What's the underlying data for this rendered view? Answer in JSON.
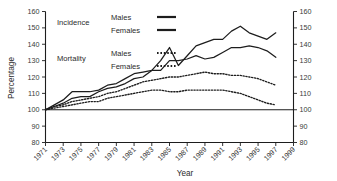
{
  "chart_data": {
    "type": "line",
    "title": "",
    "xlabel": "Year",
    "ylabel": "Percentage",
    "xlim": [
      1971,
      1999
    ],
    "ylim": [
      80,
      160
    ],
    "grid": false,
    "legend_position": "top-left-inside",
    "y_ticks": [
      80,
      90,
      100,
      110,
      120,
      130,
      140,
      150,
      160
    ],
    "y_ticks_right": [
      80,
      90,
      100,
      110,
      120,
      130,
      140,
      150,
      160
    ],
    "x_ticks": [
      1971,
      1973,
      1975,
      1977,
      1979,
      1981,
      1983,
      1985,
      1987,
      1989,
      1991,
      1993,
      1995,
      1997,
      1999
    ],
    "reference_line": 100,
    "x": [
      1971,
      1972,
      1973,
      1974,
      1975,
      1976,
      1977,
      1978,
      1979,
      1980,
      1981,
      1982,
      1983,
      1984,
      1985,
      1986,
      1987,
      1988,
      1989,
      1990,
      1991,
      1992,
      1993,
      1994,
      1995,
      1996,
      1997
    ],
    "series": [
      {
        "name": "Incidence Males",
        "group": "Incidence",
        "sex": "Males",
        "style": "solid",
        "values": [
          100,
          103,
          106,
          111,
          111,
          111,
          112,
          115,
          116,
          119,
          122,
          123,
          124,
          130,
          138,
          127,
          133,
          139,
          141,
          143,
          143,
          148,
          151,
          147,
          145,
          143,
          147
        ]
      },
      {
        "name": "Incidence Females",
        "group": "Incidence",
        "sex": "Females",
        "style": "solid",
        "values": [
          100,
          102,
          104,
          107,
          108,
          108,
          111,
          113,
          114,
          116,
          119,
          120,
          124,
          124,
          130,
          130,
          131,
          133,
          131,
          132,
          135,
          138,
          138,
          139,
          138,
          136,
          132
        ]
      },
      {
        "name": "Mortality Males",
        "group": "Mortality",
        "sex": "Males",
        "style": "dotted",
        "values": [
          100,
          102,
          103,
          105,
          106,
          107,
          108,
          110,
          111,
          113,
          115,
          117,
          118,
          119,
          120,
          120,
          121,
          122,
          123,
          122,
          122,
          121,
          121,
          120,
          119,
          117,
          115
        ]
      },
      {
        "name": "Mortality Females",
        "group": "Mortality",
        "sex": "Females",
        "style": "dotted",
        "values": [
          100,
          101,
          102,
          103,
          104,
          105,
          105,
          107,
          108,
          109,
          110,
          111,
          112,
          112,
          111,
          111,
          112,
          112,
          112,
          112,
          112,
          111,
          110,
          108,
          106,
          104,
          103
        ]
      }
    ]
  },
  "legend": {
    "groups": [
      {
        "label": "Incidence",
        "entries": [
          {
            "label": "Males",
            "style": "solid"
          },
          {
            "label": "Females",
            "style": "solid"
          }
        ]
      },
      {
        "label": "Mortality",
        "entries": [
          {
            "label": "Males",
            "style": "dotted"
          },
          {
            "label": "Females",
            "style": "dotted"
          }
        ]
      }
    ]
  },
  "colors": {
    "line": "#1d1d1d",
    "axis": "#1d1d1d",
    "text": "#2b2b2b",
    "background": "#ffffff"
  }
}
